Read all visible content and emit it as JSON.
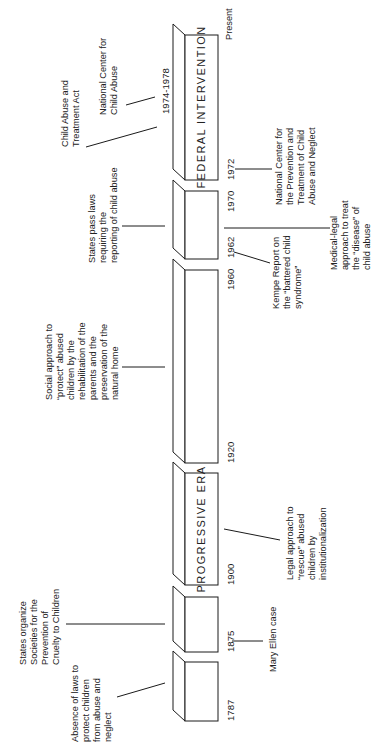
{
  "diagram": {
    "type": "timeline",
    "orientation": "rotated-90-ccw",
    "years": {
      "y1787": "1787",
      "y1875": "1875",
      "y1900": "1900",
      "y1920": "1920",
      "y1960": "1960",
      "y1962": "1962",
      "y1970": "1970",
      "y1972": "1972",
      "y1974_1978": "1974-1978",
      "present": "Present"
    },
    "eras": {
      "progressive": "PROGRESSIVE ERA",
      "federal": "FEDERAL INTERVENTION"
    },
    "annotations": {
      "absence_laws": [
        "Absence of laws to",
        "protect children",
        "from abuse and",
        "neglect"
      ],
      "states_organize": [
        "States organize",
        "Societies for the",
        "Prevention of",
        "Cruelty to Children"
      ],
      "mary_ellen": [
        "Mary Ellen case"
      ],
      "legal_approach": [
        "Legal approach to",
        "“rescue” abused",
        "children by",
        "institutionalization"
      ],
      "social_approach": [
        "Social approach to",
        "“protect” abused",
        "children by the",
        "rehabilitation of the",
        "parents and the",
        "preservation of the",
        "natural home"
      ],
      "states_pass": [
        "States pass laws",
        "requiring the",
        "reporting of child abuse"
      ],
      "kempe": [
        "Kempe Report on",
        "the “battered child",
        "syndrome”"
      ],
      "medical_legal": [
        "Medical-legal",
        "approach to treat",
        "the “disease” of",
        "child abuse"
      ],
      "nc_prevention": [
        "National Center for",
        "the Prevention and",
        "Treatment of Child",
        "Abuse and Neglect"
      ],
      "cap_act": [
        "Child Abuse and",
        "Treatment Act"
      ],
      "nc_child_abuse": [
        "National Center for",
        "Child Abuse"
      ]
    }
  }
}
